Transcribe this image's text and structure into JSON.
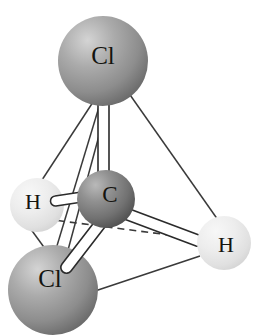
{
  "figure": {
    "molecule_formula": "CH2Cl2",
    "background_color": "#ffffff",
    "width": 259,
    "height": 336
  },
  "atoms": [
    {
      "id": "cl-top",
      "label": "Cl",
      "element": "Cl",
      "cx": 103,
      "cy": 61,
      "r": 45,
      "color": "#9a9a9a",
      "highlight_color": "#c8c8c8",
      "shadow_color": "#6e6e6e",
      "label_x": 103,
      "label_y": 58,
      "label_size": 25
    },
    {
      "id": "carbon-center",
      "label": "C",
      "element": "C",
      "cx": 106,
      "cy": 199,
      "r": 29,
      "color": "#808080",
      "highlight_color": "#b4b4b4",
      "shadow_color": "#555555",
      "label_x": 110,
      "label_y": 197,
      "label_size": 23
    },
    {
      "id": "h-left",
      "label": "H",
      "element": "H",
      "cx": 37,
      "cy": 205,
      "r": 27,
      "color": "#e2e2e2",
      "highlight_color": "#f4f4f4",
      "shadow_color": "#cacaca",
      "label_x": 33,
      "label_y": 204,
      "label_size": 22
    },
    {
      "id": "h-right",
      "label": "H",
      "element": "H",
      "cx": 224,
      "cy": 243,
      "r": 27,
      "color": "#e2e2e2",
      "highlight_color": "#f4f4f4",
      "shadow_color": "#cacaca",
      "label_x": 226,
      "label_y": 247,
      "label_size": 22
    },
    {
      "id": "cl-bottom",
      "label": "Cl",
      "element": "Cl",
      "cx": 53,
      "cy": 290,
      "r": 45,
      "color": "#9a9a9a",
      "highlight_color": "#c8c8c8",
      "shadow_color": "#6e6e6e",
      "label_x": 50,
      "label_y": 281,
      "label_size": 25
    }
  ],
  "bonds": [
    {
      "id": "bond-c-cl-top",
      "from": "carbon-center",
      "to": "cl-top",
      "style": "cylinder",
      "fill": "#ffffff",
      "stroke": "#2b2b2b"
    },
    {
      "id": "bond-c-cl-bottom",
      "from": "carbon-center",
      "to": "cl-bottom",
      "style": "cylinder",
      "fill": "#ffffff",
      "stroke": "#2b2b2b"
    },
    {
      "id": "bond-c-h-left",
      "from": "carbon-center",
      "to": "h-left",
      "style": "cylinder",
      "fill": "#ffffff",
      "stroke": "#2b2b2b"
    },
    {
      "id": "bond-c-h-right",
      "from": "carbon-center",
      "to": "h-right",
      "style": "cylinder",
      "fill": "#ffffff",
      "stroke": "#2b2b2b"
    }
  ],
  "tetrahedron_edges": [
    {
      "id": "edge-cltop-hleft",
      "from": "cl-top",
      "to": "h-left",
      "style": "solid",
      "stroke": "#3a3a3a"
    },
    {
      "id": "edge-cltop-clbottom",
      "from": "cl-top",
      "to": "cl-bottom",
      "style": "solid",
      "stroke": "#3a3a3a"
    },
    {
      "id": "edge-cltop-hright",
      "from": "cl-top",
      "to": "h-right",
      "style": "solid",
      "stroke": "#3a3a3a"
    },
    {
      "id": "edge-hleft-clbottom",
      "from": "h-left",
      "to": "cl-bottom",
      "style": "solid",
      "stroke": "#3a3a3a"
    },
    {
      "id": "edge-clbottom-hright",
      "from": "cl-bottom",
      "to": "h-right",
      "style": "solid",
      "stroke": "#3a3a3a"
    },
    {
      "id": "edge-hleft-hright",
      "from": "h-left",
      "to": "h-right",
      "style": "dashed",
      "stroke": "#3a3a3a"
    }
  ]
}
